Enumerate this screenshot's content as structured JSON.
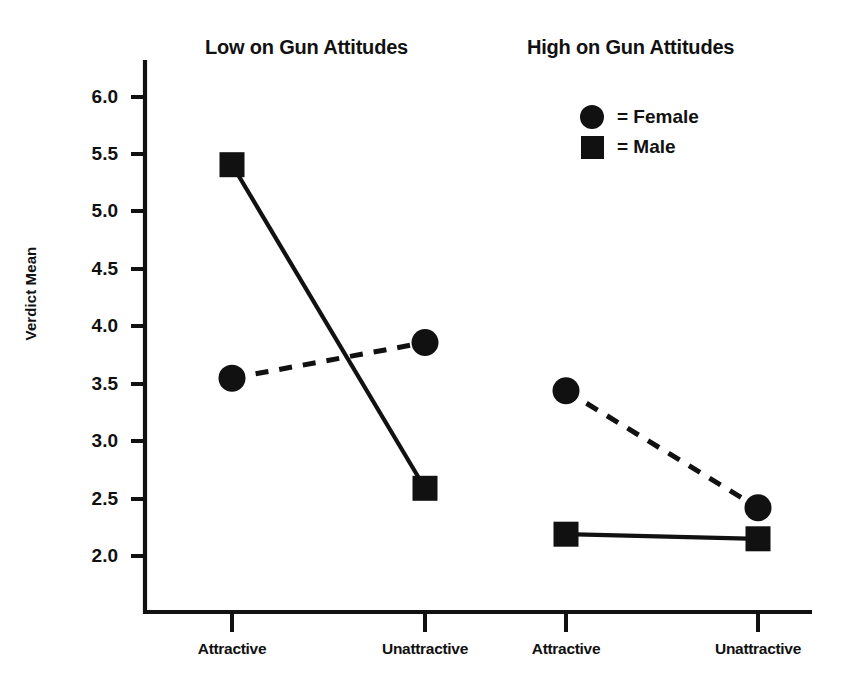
{
  "chart_data": {
    "type": "line",
    "title": "",
    "xlabel": "",
    "ylabel": "Verdict Mean",
    "ylim": [
      1.65,
      6.25
    ],
    "yticks": [
      2.0,
      2.5,
      3.0,
      3.5,
      4.0,
      4.5,
      5.0,
      5.5,
      6.0
    ],
    "ytick_labels": [
      "2.0",
      "2.5",
      "3.0",
      "3.5",
      "4.0",
      "4.5",
      "5.0",
      "5.5",
      "6.0"
    ],
    "grid": false,
    "legend_position": "top-right",
    "panels": [
      {
        "title": "Low on Gun Attitudes",
        "categories": [
          "Attractive",
          "Unattractive"
        ]
      },
      {
        "title": "High on Gun Attitudes",
        "categories": [
          "Attractive",
          "Unattractive"
        ]
      }
    ],
    "categories": [
      "Attractive",
      "Unattractive",
      "Attractive",
      "Unattractive"
    ],
    "series": [
      {
        "name": "Female",
        "marker": "circle",
        "linestyle": "dashed",
        "values": [
          3.55,
          3.86,
          3.44,
          2.42
        ]
      },
      {
        "name": "Male",
        "marker": "square",
        "linestyle": "solid",
        "values": [
          5.41,
          2.59,
          2.19,
          2.15
        ]
      }
    ],
    "legend": [
      {
        "marker": "circle",
        "equals": "=",
        "label": "Female"
      },
      {
        "marker": "square",
        "equals": "=",
        "label": "Male"
      }
    ],
    "colors": {
      "ink": "#111111",
      "background": "#ffffff"
    }
  },
  "panel_titles": {
    "low": "Low on Gun Attitudes",
    "high": "High on Gun Attitudes"
  },
  "axes": {
    "y_label": "Verdict Mean",
    "y_ticks": [
      "6.0",
      "5.5",
      "5.0",
      "4.5",
      "4.0",
      "3.5",
      "3.0",
      "2.5",
      "2.0"
    ],
    "x_ticks": [
      "Attractive",
      "Unattractive",
      "Attractive",
      "Unattractive"
    ]
  },
  "legend": {
    "female": {
      "equals": "=",
      "label": "= Female"
    },
    "male": {
      "equals": "=",
      "label": "= Male"
    }
  }
}
